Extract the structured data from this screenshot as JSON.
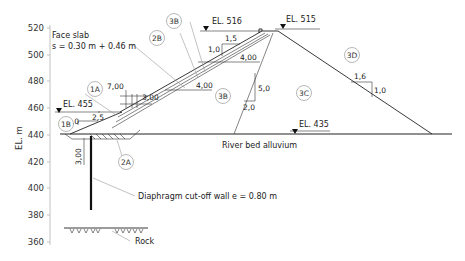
{
  "axis": {
    "label": "EL. m",
    "ticks": [
      {
        "label": "520",
        "y": 28
      },
      {
        "label": "500",
        "y": 55
      },
      {
        "label": "480",
        "y": 81
      },
      {
        "label": "460",
        "y": 108
      },
      {
        "label": "440",
        "y": 135
      },
      {
        "label": "420",
        "y": 162
      },
      {
        "label": "400",
        "y": 188
      },
      {
        "label": "380",
        "y": 215
      },
      {
        "label": "360",
        "y": 242
      }
    ]
  },
  "elevations": {
    "el_516": "EL. 516",
    "el_515": "EL. 515",
    "el_455": "EL. 455",
    "el_435": "EL. 435"
  },
  "labels": {
    "face_slab_line1": "Face slab",
    "face_slab_line2": "s = 0.30 m + 0.46 m",
    "river_bed": "River bed alluvium",
    "diaphragm": "Diaphragm cut-off wall e = 0.80 m",
    "rock": "Rock"
  },
  "zones": {
    "z1A": "1A",
    "z1B": "1B",
    "z2A": "2A",
    "z2B": "2B",
    "z3B_top": "3B",
    "z3B_mid": "3B",
    "z3C": "3C",
    "z3D": "3D"
  },
  "dimensions": {
    "berm_width": "7,00",
    "berm_height": "3,00",
    "slope_1B_v": "1,0",
    "slope_1B_h": "2,5",
    "crest_h": "1,5",
    "crest_v": "1,0",
    "width_4_upper": "4,00",
    "width_4_lower": "4,00",
    "core_v": "5,0",
    "core_h": "2,0",
    "ds_h": "1,6",
    "ds_v": "1,0",
    "wall_depth": "3,00"
  }
}
